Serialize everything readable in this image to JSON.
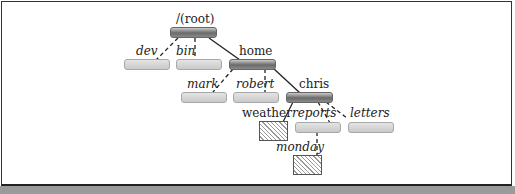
{
  "diagram": {
    "type": "directory-tree",
    "nodes": [
      {
        "id": "root",
        "label": "/(root)",
        "kind": "directory",
        "style": "dark",
        "parent": null
      },
      {
        "id": "dev",
        "label": "dev",
        "kind": "directory",
        "style": "light",
        "parent": "root"
      },
      {
        "id": "bin",
        "label": "bin",
        "kind": "directory",
        "style": "light",
        "parent": "root"
      },
      {
        "id": "home",
        "label": "home",
        "kind": "directory",
        "style": "dark",
        "parent": "root"
      },
      {
        "id": "mark",
        "label": "mark",
        "kind": "directory",
        "style": "light",
        "parent": "home"
      },
      {
        "id": "robert",
        "label": "robert",
        "kind": "directory",
        "style": "light",
        "parent": "home"
      },
      {
        "id": "chris",
        "label": "chris",
        "kind": "directory",
        "style": "dark",
        "parent": "home"
      },
      {
        "id": "weather",
        "label": "weather",
        "kind": "file",
        "style": "hatched",
        "parent": "chris"
      },
      {
        "id": "reports",
        "label": "reports",
        "kind": "directory",
        "style": "light",
        "parent": "chris"
      },
      {
        "id": "letters",
        "label": "letters",
        "kind": "directory",
        "style": "light",
        "parent": "chris"
      },
      {
        "id": "monday",
        "label": "monday",
        "kind": "file",
        "style": "hatched",
        "parent": "reports"
      }
    ],
    "edges": [
      {
        "from": "root",
        "to": "dev",
        "line": "dashed"
      },
      {
        "from": "root",
        "to": "bin",
        "line": "dashed"
      },
      {
        "from": "root",
        "to": "home",
        "line": "solid"
      },
      {
        "from": "home",
        "to": "mark",
        "line": "dashed"
      },
      {
        "from": "home",
        "to": "robert",
        "line": "dashed"
      },
      {
        "from": "home",
        "to": "chris",
        "line": "solid"
      },
      {
        "from": "chris",
        "to": "weather",
        "line": "solid"
      },
      {
        "from": "chris",
        "to": "reports",
        "line": "dashed"
      },
      {
        "from": "chris",
        "to": "letters",
        "line": "dashed"
      },
      {
        "from": "reports",
        "to": "monday",
        "line": "dashed"
      }
    ]
  },
  "labels": {
    "root": "/(root)",
    "dev": "dev",
    "bin": "bin",
    "home": "home",
    "mark": "mark",
    "robert": "robert",
    "chris": "chris",
    "weather": "weather",
    "reports": "reports",
    "letters": "letters",
    "monday": "monday"
  }
}
